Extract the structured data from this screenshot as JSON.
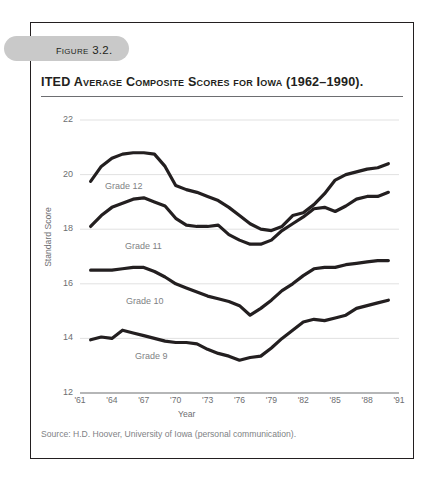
{
  "figure": {
    "tag": "Figure 3.2.",
    "title": "ITED Average Composite Scores for Iowa (1962–1990).",
    "source": "Source: H.D. Hoover, University of Iowa (personal communication)."
  },
  "chart_data": {
    "type": "line",
    "title": "ITED Average Composite Scores for Iowa (1962–1990).",
    "xlabel": "Year",
    "ylabel": "Standard Score",
    "xlim": [
      1961,
      1991
    ],
    "ylim": [
      12,
      22
    ],
    "yticks": [
      12,
      14,
      16,
      18,
      20,
      22
    ],
    "xticks": [
      1961,
      1964,
      1967,
      1970,
      1973,
      1976,
      1979,
      1982,
      1985,
      1988,
      1991
    ],
    "xtick_labels": [
      "'61",
      "'64",
      "'67",
      "'70",
      "'73",
      "'76",
      "'79",
      "'82",
      "'85",
      "'88",
      "'91"
    ],
    "grid": "horizontal",
    "legend": "inline-labels",
    "x": [
      1962,
      1963,
      1964,
      1965,
      1966,
      1967,
      1968,
      1969,
      1970,
      1971,
      1972,
      1973,
      1974,
      1975,
      1976,
      1977,
      1978,
      1979,
      1980,
      1981,
      1982,
      1983,
      1984,
      1985,
      1986,
      1987,
      1988,
      1989,
      1990
    ],
    "series": [
      {
        "name": "Grade 12",
        "label": "Grade 12",
        "color": "#231f20",
        "values": [
          19.75,
          20.3,
          20.6,
          20.75,
          20.8,
          20.8,
          20.75,
          20.3,
          19.6,
          19.45,
          19.35,
          19.2,
          19.05,
          18.8,
          18.5,
          18.2,
          18.0,
          17.95,
          18.1,
          18.5,
          18.6,
          18.9,
          19.3,
          19.8,
          20.0,
          20.1,
          20.2,
          20.25,
          20.4
        ]
      },
      {
        "name": "Grade 11",
        "label": "Grade 11",
        "color": "#231f20",
        "values": [
          18.1,
          18.5,
          18.8,
          18.95,
          19.1,
          19.15,
          19.0,
          18.85,
          18.4,
          18.15,
          18.1,
          18.1,
          18.15,
          17.8,
          17.6,
          17.45,
          17.45,
          17.6,
          17.95,
          18.2,
          18.45,
          18.75,
          18.8,
          18.65,
          18.85,
          19.1,
          19.2,
          19.2,
          19.35
        ]
      },
      {
        "name": "Grade 10",
        "label": "Grade 10",
        "color": "#231f20",
        "values": [
          16.5,
          16.5,
          16.5,
          16.55,
          16.6,
          16.6,
          16.45,
          16.25,
          16.0,
          15.85,
          15.7,
          15.55,
          15.45,
          15.35,
          15.2,
          14.85,
          15.1,
          15.4,
          15.75,
          16.0,
          16.3,
          16.55,
          16.6,
          16.6,
          16.7,
          16.75,
          16.8,
          16.85,
          16.85
        ]
      },
      {
        "name": "Grade 9",
        "label": "Grade 9",
        "color": "#231f20",
        "values": [
          13.95,
          14.05,
          14.0,
          14.3,
          14.2,
          14.1,
          14.0,
          13.9,
          13.85,
          13.85,
          13.8,
          13.6,
          13.45,
          13.35,
          13.2,
          13.3,
          13.35,
          13.65,
          14.0,
          14.3,
          14.6,
          14.7,
          14.65,
          14.75,
          14.85,
          15.1,
          15.2,
          15.3,
          15.4
        ]
      }
    ],
    "series_label_positions": [
      {
        "name": "Grade 12",
        "x": 105,
        "y": 181
      },
      {
        "name": "Grade 11",
        "x": 125,
        "y": 241
      },
      {
        "name": "Grade 10",
        "x": 126,
        "y": 296
      },
      {
        "name": "Grade 9",
        "x": 135,
        "y": 351
      }
    ]
  }
}
